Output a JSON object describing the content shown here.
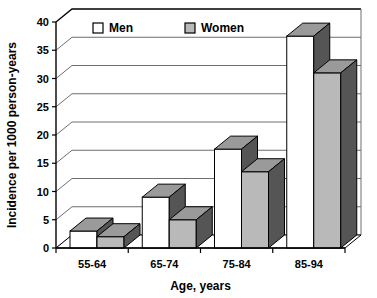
{
  "chart_data": {
    "type": "bar",
    "title": "",
    "subtitle": "",
    "xlabel": "Age, years",
    "ylabel": "Incidence per 1000 person-years",
    "categories": [
      "55-64",
      "65-74",
      "75-84",
      "85-94"
    ],
    "series": [
      {
        "name": "Men",
        "values": [
          3,
          9,
          17.5,
          37.5
        ],
        "color": "#ffffff"
      },
      {
        "name": "Women",
        "values": [
          2,
          5,
          13.5,
          31
        ],
        "color": "#b9b9b9"
      }
    ],
    "yticks": [
      0,
      5,
      10,
      15,
      20,
      25,
      30,
      35,
      40
    ],
    "ylim": [
      0,
      40
    ],
    "grid": true,
    "legend_position": "top-center",
    "style": "3d-perspective",
    "side_face_color": "#555555",
    "top_face_color": "#9a9a9a",
    "axis_color": "#000000",
    "gridline_color": "#6e6e6e"
  },
  "axis": {
    "y_title": "Incidence per 1000 person-years",
    "x_title": "Age, years",
    "y_ticks": [
      "0",
      "5",
      "10",
      "15",
      "20",
      "25",
      "30",
      "35",
      "40"
    ],
    "x_ticks": [
      "55-64",
      "65-74",
      "75-84",
      "85-94"
    ]
  },
  "legend": {
    "items": [
      {
        "label": "Men",
        "swatch": "legend-swatch-men"
      },
      {
        "label": "Women",
        "swatch": "legend-swatch-women"
      }
    ]
  }
}
